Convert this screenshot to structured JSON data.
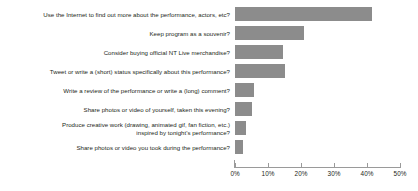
{
  "chart_data": {
    "type": "bar",
    "orientation": "horizontal",
    "title": "",
    "xlabel": "",
    "ylabel": "",
    "xlim": [
      0,
      50
    ],
    "xticks": [
      "0%",
      "10%",
      "20%",
      "30%",
      "40%",
      "50%"
    ],
    "xtick_values": [
      0,
      10,
      20,
      30,
      40,
      50
    ],
    "grid": false,
    "legend": false,
    "bar_color": "#8c8c8c",
    "axis_color": "#9a9a9a",
    "text_color": "#231f20",
    "categories": [
      "Use the Internet to find out more about the performance, actors, etc?",
      "Keep program as a souvenir?",
      "Consider buying official NT Live merchandise?",
      "Tweet or write a (short) status specifically about this performance?",
      "Write a review of the performance or write a (long) comment?",
      "Share photos or video of yourself, taken this evening?",
      "Produce creative work (drawing, animated gif, fan fiction, etc.)\ninspired by tonight's performance?",
      "Share photos or video you took during the performance?"
    ],
    "values": [
      41.5,
      21,
      14.5,
      15,
      5.8,
      5,
      3.3,
      2.5
    ]
  }
}
